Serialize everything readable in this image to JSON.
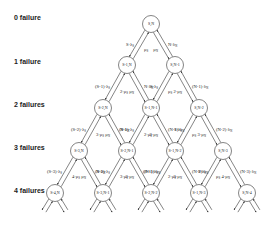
{
  "row_labels": [
    "0 failure",
    "1 failure",
    "2 failures",
    "3 failures",
    "4 failures"
  ],
  "nodes": [
    [
      "S,N"
    ],
    [
      "S-1,N",
      "S,N-1"
    ],
    [
      "S-2,N",
      "S-1,N-1",
      "S,N-2"
    ],
    [
      "S-3,N",
      "S-2,N-1",
      "S-1,N-2",
      "S,N-3"
    ],
    [
      "S-4,N",
      "S-3,N-1",
      "S-2,N-2",
      "S-1,N-3",
      "S,N-4"
    ]
  ],
  "edge_labels": {
    "row0": {
      "left_fail": "S·λS",
      "left_repair": "μS",
      "right_fail": "N·λN",
      "right_repair": "μN"
    },
    "row1": [
      {
        "left_fail": "(S-1)·λS",
        "left_repair": "2·μS",
        "right_fail": "N·λN",
        "right_repair": "μN"
      },
      {
        "left_fail": "S·λS",
        "left_repair": "μS",
        "right_fail": "(N-1)·λN",
        "right_repair": "2·μN"
      }
    ],
    "row2": [
      {
        "left_fail": "(S-2)·λS",
        "left_repair": "3·μS",
        "right_fail": "N·λN",
        "right_repair": "μN"
      },
      {
        "left_fail": "(S-1)·λS",
        "left_repair": "2·μS",
        "right_fail": "(N-1)·λN",
        "right_repair": "2·μN"
      },
      {
        "left_fail": "S·λS",
        "left_repair": "μS",
        "right_fail": "(N-2)·λN",
        "right_repair": "3·μN"
      }
    ],
    "row3": [
      {
        "left_fail": "(S-3)·λS",
        "left_repair": "4·μS",
        "right_fail": "N·λN",
        "right_repair": "μN"
      },
      {
        "left_fail": "(S-2)·λS",
        "left_repair": "3·μS",
        "right_fail": "(N-1)·λN",
        "right_repair": "2·μN"
      },
      {
        "left_fail": "(S-1)·λS",
        "left_repair": "2·μS",
        "right_fail": "(N-2)·λN",
        "right_repair": "3·μN"
      },
      {
        "left_fail": "S·λS",
        "left_repair": "μS",
        "right_fail": "(N-3)·λN",
        "right_repair": "4·μN"
      }
    ]
  },
  "colors": {
    "stroke": "#333333",
    "node_fill": "#ffffff",
    "text": "#222222"
  }
}
